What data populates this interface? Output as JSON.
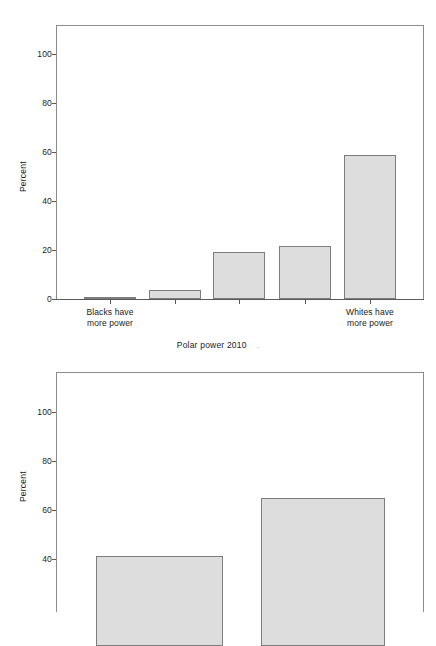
{
  "chart_data": [
    {
      "id": "top-chart",
      "type": "bar",
      "title": "",
      "xlabel": "Polar power 2010",
      "ylabel": "Percent",
      "ylim": [
        0,
        112
      ],
      "yticks": [
        0,
        20,
        40,
        60,
        80,
        100
      ],
      "ytick_labels": [
        "0",
        "20",
        "40",
        "60",
        "80",
        "100"
      ],
      "grid": false,
      "legend": "none",
      "categories": [
        "1",
        "2",
        "3",
        "4",
        "5"
      ],
      "category_labels": [
        "Blacks have\nmore power",
        "",
        "",
        "",
        "Whites have\nmore power"
      ],
      "values": [
        0.8,
        3.5,
        19.2,
        21.8,
        58.8
      ],
      "bar_fill": "#dddddd",
      "bar_edge": "#7d7d7d"
    },
    {
      "id": "bottom-chart",
      "type": "bar",
      "title": "",
      "xlabel": "",
      "ylabel": "Percent",
      "ylim": [
        0,
        112
      ],
      "yticks": [
        40,
        60,
        80,
        100
      ],
      "ytick_labels": [
        "40",
        "60",
        "80",
        "100"
      ],
      "grid": false,
      "legend": "none",
      "categories": [
        "1",
        "2"
      ],
      "category_labels": [
        "",
        ""
      ],
      "values": [
        38.5,
        63.0
      ],
      "bar_fill": "#dddddd",
      "bar_edge": "#7d7d7d",
      "note_cropped": "bottom of plot extends past image edge"
    }
  ],
  "top_chart": {
    "ylabel": "Percent",
    "xlabel_text": "Polar power 2010",
    "xlabel_trailing_mark": ".",
    "yticks": {
      "t0": "0",
      "t20": "20",
      "t40": "40",
      "t60": "60",
      "t80": "80",
      "t100": "100"
    },
    "cat_left_line1": "Blacks have",
    "cat_left_line2": "more power",
    "cat_right_line1": "Whites have",
    "cat_right_line2": "more power"
  },
  "bottom_chart": {
    "ylabel": "Percent",
    "yticks": {
      "t40": "40",
      "t60": "60",
      "t80": "80",
      "t100": "100"
    }
  }
}
